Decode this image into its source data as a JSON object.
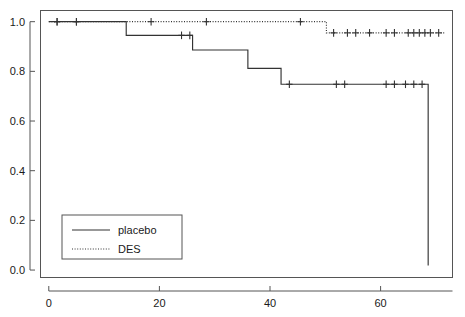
{
  "chart_data": {
    "type": "line",
    "subtype": "kaplan-meier-step",
    "title": "",
    "xlabel": "",
    "ylabel": "",
    "xlim": [
      -1.5,
      73
    ],
    "ylim": [
      -0.03,
      1.045
    ],
    "grid": false,
    "legend_position": "bottom-left-inside",
    "xticks": [
      0,
      20,
      40,
      60
    ],
    "xticklabels": [
      "0",
      "20",
      "40",
      "60"
    ],
    "yticks": [
      0.0,
      0.2,
      0.4,
      0.6,
      0.8,
      1.0
    ],
    "yticklabels": [
      "0.0",
      "0.2",
      "0.4",
      "0.6",
      "0.8",
      "1.0"
    ],
    "series": [
      {
        "name": "placebo",
        "linestyle": "solid",
        "color": "#333333",
        "steps_x": [
          0,
          14,
          14,
          26,
          26,
          36,
          36,
          42,
          42,
          68.6,
          68.6
        ],
        "steps_y": [
          1.0,
          1.0,
          0.945,
          0.945,
          0.886,
          0.886,
          0.812,
          0.812,
          0.748,
          0.748,
          0.018
        ],
        "censor_x": [
          1.5,
          5.0,
          24.0,
          25.5,
          43.5,
          52.0,
          53.5,
          61.0,
          62.5,
          64.5,
          66.0,
          67.5
        ],
        "censor_y": [
          1.0,
          1.0,
          0.945,
          0.945,
          0.748,
          0.748,
          0.748,
          0.748,
          0.748,
          0.748,
          0.748,
          0.748
        ]
      },
      {
        "name": "DES",
        "linestyle": "dotted",
        "color": "#333333",
        "steps_x": [
          0,
          50.2,
          50.2,
          71.5
        ],
        "steps_y": [
          1.0,
          1.0,
          0.955,
          0.955
        ],
        "censor_x": [
          1.5,
          5.0,
          18.5,
          28.5,
          45.5,
          51.5,
          54.0,
          55.5,
          58.0,
          61.0,
          62.5,
          65.0,
          66.0,
          67.0,
          68.0,
          69.0,
          70.5
        ],
        "censor_y": [
          1.0,
          1.0,
          1.0,
          1.0,
          1.0,
          0.955,
          0.955,
          0.955,
          0.955,
          0.955,
          0.955,
          0.955,
          0.955,
          0.955,
          0.955,
          0.955,
          0.955
        ]
      }
    ]
  },
  "legend": {
    "entries": [
      {
        "label": "placebo",
        "style": "solid"
      },
      {
        "label": "DES",
        "style": "dotted"
      }
    ]
  },
  "colors": {
    "line": "#333333",
    "axis": "#555555",
    "text": "#1a1a1a",
    "background": "#ffffff"
  }
}
